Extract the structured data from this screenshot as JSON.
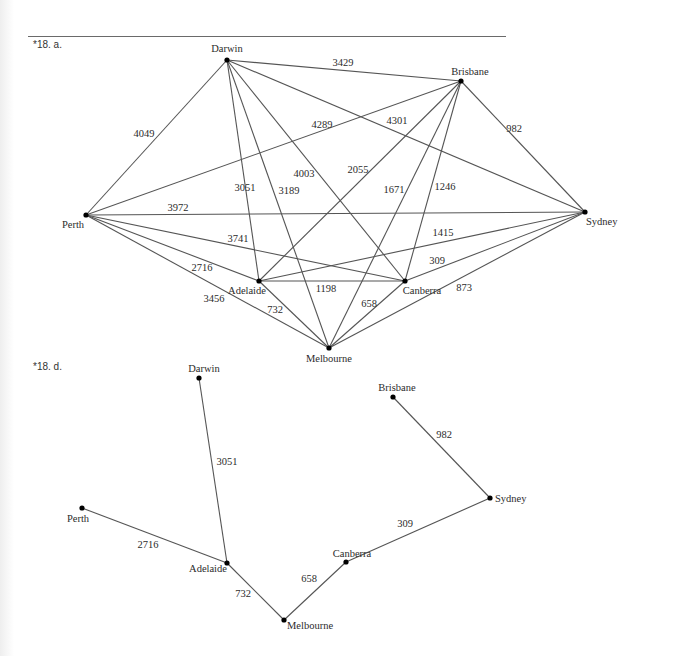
{
  "problems": [
    {
      "label": "*18. a.",
      "label_pos": [
        33,
        48
      ],
      "nodes": [
        {
          "name": "Darwin",
          "x": 227,
          "y": 60,
          "lx": 227,
          "ly": 52,
          "anchor": "middle"
        },
        {
          "name": "Brisbane",
          "x": 461,
          "y": 81,
          "lx": 470,
          "ly": 75,
          "anchor": "middle"
        },
        {
          "name": "Sydney",
          "x": 585,
          "y": 212,
          "lx": 586,
          "ly": 225,
          "anchor": "start"
        },
        {
          "name": "Perth",
          "x": 86,
          "y": 215,
          "lx": 73,
          "ly": 228,
          "anchor": "middle"
        },
        {
          "name": "Adelaide",
          "x": 259,
          "y": 281,
          "lx": 247,
          "ly": 294,
          "anchor": "middle"
        },
        {
          "name": "Canberra",
          "x": 405,
          "y": 281,
          "lx": 422,
          "ly": 294,
          "anchor": "middle"
        },
        {
          "name": "Melbourne",
          "x": 329,
          "y": 348,
          "lx": 329,
          "ly": 362,
          "anchor": "middle"
        }
      ],
      "edges": [
        {
          "from": "Darwin",
          "to": "Brisbane",
          "weight": "3429",
          "lx": 343,
          "ly": 66
        },
        {
          "from": "Darwin",
          "to": "Perth",
          "weight": "4049",
          "lx": 144,
          "ly": 137
        },
        {
          "from": "Darwin",
          "to": "Sydney",
          "weight": "4301",
          "lx": 397,
          "ly": 124
        },
        {
          "from": "Darwin",
          "to": "Adelaide",
          "weight": "3051",
          "lx": 245,
          "ly": 191
        },
        {
          "from": "Darwin",
          "to": "Melbourne",
          "weight": "3189",
          "lx": 289,
          "ly": 194
        },
        {
          "from": "Darwin",
          "to": "Canberra",
          "weight": "4003",
          "lx": 304,
          "ly": 177
        },
        {
          "from": "Brisbane",
          "to": "Perth",
          "weight": "4289",
          "lx": 322,
          "ly": 128
        },
        {
          "from": "Brisbane",
          "to": "Sydney",
          "weight": "982",
          "lx": 514,
          "ly": 132
        },
        {
          "from": "Brisbane",
          "to": "Adelaide",
          "weight": "2055",
          "lx": 358,
          "ly": 173
        },
        {
          "from": "Brisbane",
          "to": "Melbourne",
          "weight": "1671",
          "lx": 394,
          "ly": 193
        },
        {
          "from": "Brisbane",
          "to": "Canberra",
          "weight": "1246",
          "lx": 445,
          "ly": 190
        },
        {
          "from": "Perth",
          "to": "Sydney",
          "weight": "3972",
          "lx": 178,
          "ly": 211
        },
        {
          "from": "Perth",
          "to": "Canberra",
          "weight": "3741",
          "lx": 238,
          "ly": 242
        },
        {
          "from": "Perth",
          "to": "Adelaide",
          "weight": "2716",
          "lx": 202,
          "ly": 271
        },
        {
          "from": "Perth",
          "to": "Melbourne",
          "weight": "3456",
          "lx": 214,
          "ly": 302
        },
        {
          "from": "Sydney",
          "to": "Adelaide",
          "weight": "1415",
          "lx": 443,
          "ly": 236
        },
        {
          "from": "Sydney",
          "to": "Canberra",
          "weight": "309",
          "lx": 437,
          "ly": 264
        },
        {
          "from": "Sydney",
          "to": "Melbourne",
          "weight": "873",
          "lx": 464,
          "ly": 291
        },
        {
          "from": "Adelaide",
          "to": "Canberra",
          "weight": "1198",
          "lx": 326,
          "ly": 292
        },
        {
          "from": "Adelaide",
          "to": "Melbourne",
          "weight": "732",
          "lx": 275,
          "ly": 313
        },
        {
          "from": "Canberra",
          "to": "Melbourne",
          "weight": "658",
          "lx": 369,
          "ly": 307
        }
      ]
    },
    {
      "label": "*18. d.",
      "label_pos": [
        33,
        370
      ],
      "nodes": [
        {
          "name": "Darwin",
          "x": 199,
          "y": 378,
          "lx": 204,
          "ly": 372,
          "anchor": "middle"
        },
        {
          "name": "Brisbane",
          "x": 393,
          "y": 397,
          "lx": 397,
          "ly": 391,
          "anchor": "middle"
        },
        {
          "name": "Sydney",
          "x": 490,
          "y": 498,
          "lx": 495,
          "ly": 502,
          "anchor": "start"
        },
        {
          "name": "Perth",
          "x": 82,
          "y": 508,
          "lx": 78,
          "ly": 522,
          "anchor": "middle"
        },
        {
          "name": "Adelaide",
          "x": 227,
          "y": 563,
          "lx": 208,
          "ly": 572,
          "anchor": "middle"
        },
        {
          "name": "Canberra",
          "x": 346,
          "y": 562,
          "lx": 352,
          "ly": 557,
          "anchor": "middle"
        },
        {
          "name": "Melbourne",
          "x": 284,
          "y": 620,
          "lx": 287,
          "ly": 629,
          "anchor": "start"
        }
      ],
      "edges": [
        {
          "from": "Darwin",
          "to": "Adelaide",
          "weight": "3051",
          "lx": 227,
          "ly": 465
        },
        {
          "from": "Perth",
          "to": "Adelaide",
          "weight": "2716",
          "lx": 148,
          "ly": 548
        },
        {
          "from": "Adelaide",
          "to": "Melbourne",
          "weight": "732",
          "lx": 243,
          "ly": 597
        },
        {
          "from": "Canberra",
          "to": "Melbourne",
          "weight": "658",
          "lx": 309,
          "ly": 582
        },
        {
          "from": "Canberra",
          "to": "Sydney",
          "weight": "309",
          "lx": 405,
          "ly": 527
        },
        {
          "from": "Brisbane",
          "to": "Sydney",
          "weight": "982",
          "lx": 444,
          "ly": 438
        }
      ]
    }
  ],
  "colors": {
    "edge": "#555555",
    "node": "#000000",
    "text": "#2b2b2b"
  }
}
